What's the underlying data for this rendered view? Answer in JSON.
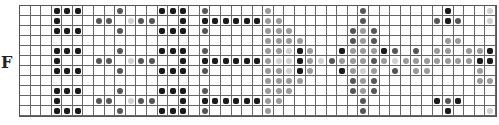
{
  "panel_label": "F",
  "grid": {
    "columns": 45,
    "rows": 11,
    "legend": {
      ".": "empty",
      "k": "black dot",
      "d": "dark gray dot",
      "m": "gray dot",
      "l": "light gray dot"
    },
    "pattern": [
      "...kkk...d...kkk.d.....m........d.......k...ll",
      "...k...dd.ldd..k.kkkkkkmm.......d......dkd..l.",
      "...kkk...d...kkk.d.....mmm.....dmd...........k",
      ".......................mmmm....dmd......mm...k",
      "...kkk...d...kkk.d.....mmlkm..kmmmkd.d.mm.mmk.",
      "...k...dd.ldd..k.kkkkkkmllkmldmmmdmlmmmmmmmkkm",
      "...kkk...d...kkk.d.....mmlkm..kmlm.d.mm....m.k",
      ".......................mmmm....dmd.........mm.",
      "...kkk...d...kkk.d.....mmm.....dmd...........k",
      "...k...dd.ldd..k.kkkkkkmm.......d......kdk...l",
      "...kkk...d...kkk.d.....m........d.......k...l."
    ]
  }
}
